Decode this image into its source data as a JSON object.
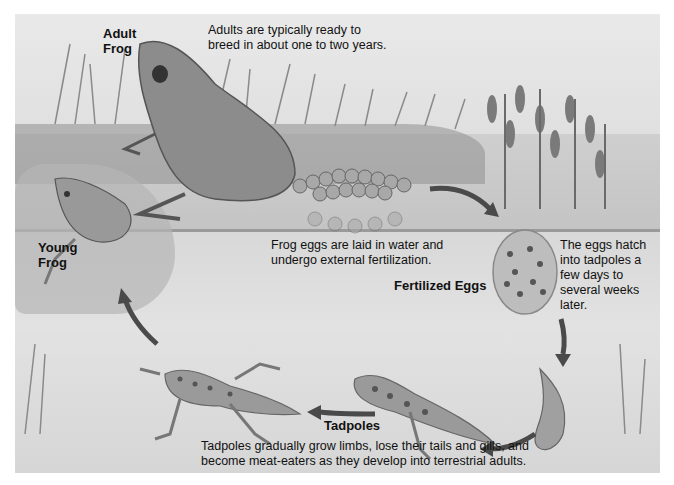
{
  "diagram": {
    "stages": [
      {
        "id": "adult",
        "label": "Adult\nFrog",
        "label_lines": [
          "Adult",
          "Frog"
        ],
        "description_lines": [
          "Adults are typically ready to",
          "breed in about one to two years."
        ]
      },
      {
        "id": "eggs",
        "label": "Fertilized Eggs",
        "description_lines": [
          "Frog eggs are laid in water and",
          "undergo external fertilization."
        ]
      },
      {
        "id": "hatch",
        "description_lines": [
          "The eggs hatch",
          "into tadpoles a",
          "few days to",
          "several weeks",
          "later."
        ]
      },
      {
        "id": "tadpoles",
        "label": "Tadpoles",
        "description_lines": [
          "Tadpoles gradually grow limbs, lose their tails and gills, and",
          "become meat-eaters as they develop into terrestrial adults."
        ]
      },
      {
        "id": "young",
        "label_lines": [
          "Young",
          "Frog"
        ]
      }
    ],
    "arrows": [
      "eggs-to-egg-mass",
      "egg-mass-to-hatchling",
      "hatchling-to-tadpole",
      "tadpole-to-late-tadpole",
      "late-tadpole-to-young-frog"
    ],
    "colors": {
      "background": "#ffffff",
      "scene": "#e0e0e0",
      "water": "#c8c8c8",
      "arrow": "#4a4a4a",
      "text": "#111111"
    }
  }
}
